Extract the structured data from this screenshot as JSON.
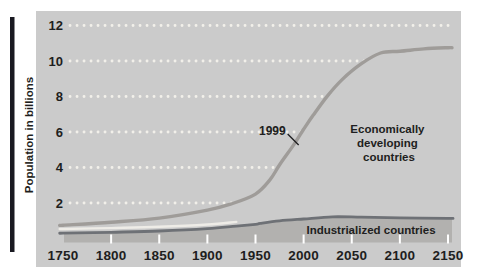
{
  "figure": {
    "y_axis_title": "Population in billions",
    "region_labels": {
      "developing_lines": [
        "Economically",
        "developing",
        "countries"
      ],
      "industrialized": "Industrialized countries"
    }
  },
  "colors": {
    "page_bg": "#ffffff",
    "panel_bg": "#cbcbcb",
    "grid_dots": "#f2f0ea",
    "developing_curve": "#9f9c99",
    "industrialized_curve": "#6e7176",
    "industrialized_fill": "#b2b1af",
    "keyline_white": "#eeece7",
    "text": "#1e1e20",
    "edge_bar": "#191921"
  },
  "chart_data": {
    "type": "line",
    "title": "",
    "xlabel": "",
    "ylabel": "Population in billions",
    "xlim": [
      1750,
      2150
    ],
    "ylim": [
      0,
      12.6
    ],
    "x_ticks": [
      1750,
      1800,
      1850,
      1900,
      1950,
      2000,
      2050,
      2100,
      2150
    ],
    "y_ticks": [
      2,
      4,
      6,
      8,
      10,
      12
    ],
    "grid": "horizontal white dotted lines on gray panel",
    "legend_position": "labels inside plot",
    "annotations": [
      {
        "text": "1999",
        "x": 1999,
        "y": 6.0
      }
    ],
    "series": [
      {
        "name": "Economically developing countries",
        "style": "line",
        "x": [
          1750,
          1800,
          1850,
          1900,
          1925,
          1950,
          1965,
          1975,
          1990,
          2000,
          2010,
          2025,
          2040,
          2060,
          2080,
          2100,
          2125,
          2150
        ],
        "y": [
          0.75,
          0.92,
          1.15,
          1.6,
          1.95,
          2.5,
          3.3,
          4.15,
          5.3,
          6.15,
          6.95,
          8.05,
          8.95,
          9.85,
          10.45,
          10.55,
          10.68,
          10.75
        ]
      },
      {
        "name": "Industrialized countries",
        "style": "line with shaded area below",
        "x": [
          1750,
          1800,
          1850,
          1900,
          1930,
          1950,
          1955,
          1975,
          2000,
          2030,
          2060,
          2100,
          2150
        ],
        "y": [
          0.3,
          0.35,
          0.42,
          0.55,
          0.7,
          0.8,
          0.85,
          1.0,
          1.1,
          1.22,
          1.2,
          1.16,
          1.13
        ]
      }
    ]
  }
}
